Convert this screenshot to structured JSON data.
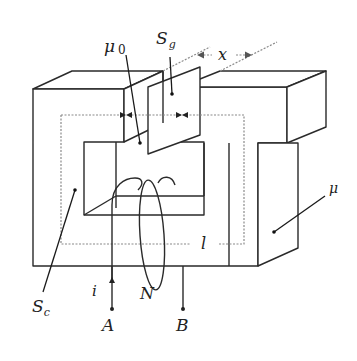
{
  "diagram": {
    "labels": {
      "mu0": "μ",
      "mu0_sub": "0",
      "sg": "S",
      "sg_sub": "g",
      "x": "x",
      "mu": "μ",
      "sc": "S",
      "sc_sub": "c",
      "l": "l",
      "i": "i",
      "n": "N",
      "a": "A",
      "b": "B"
    },
    "components": [
      {
        "id": "core",
        "description": "C-shaped magnetic core with permeability μ"
      },
      {
        "id": "air-gap",
        "description": "Air gap with permeability μ0 and area Sg"
      },
      {
        "id": "plate",
        "description": "Movable plate displaced by x inside the gap"
      },
      {
        "id": "coil",
        "description": "Winding of N turns carrying current i between terminals A and B"
      },
      {
        "id": "mean-path",
        "description": "Dashed mean magnetic path of length l"
      },
      {
        "id": "core-section",
        "description": "Core cross-section area Sc"
      }
    ],
    "colors": {
      "stroke": "#2a2a2a",
      "dashed_path": "#8a8a8a",
      "background": "#ffffff"
    }
  }
}
